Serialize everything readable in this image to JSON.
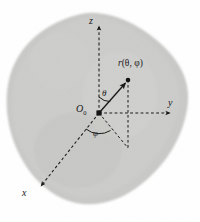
{
  "figure": {
    "kind": "spherical-coordinate-diagram",
    "caption": "",
    "background_color": "#ffffff"
  },
  "body_region": {
    "name": "irregular-solid-blob",
    "fill_color": "#c9c9c7",
    "edge_color": "#b6b6b3",
    "description": "irregular gray solid occupying most of the frame"
  },
  "origin": {
    "label": "O",
    "subscript": "0",
    "marker": "filled-square",
    "x": 99,
    "y": 113
  },
  "axes": [
    {
      "id": "z",
      "label": "z",
      "style": "dashed",
      "arrow": true,
      "from": [
        99,
        113
      ],
      "to": [
        99,
        20
      ],
      "label_x": 89,
      "label_y": 24
    },
    {
      "id": "y",
      "label": "y",
      "style": "dashed",
      "arrow": true,
      "from": [
        99,
        113
      ],
      "to": [
        176,
        113
      ],
      "label_x": 168,
      "label_y": 106
    },
    {
      "id": "x",
      "label": "x",
      "style": "dashed",
      "arrow": true,
      "from": [
        99,
        113
      ],
      "to": [
        36,
        192
      ],
      "label_x": 24,
      "label_y": 196
    }
  ],
  "radius_vector": {
    "label_r": "r",
    "label_args": "(θ, φ)",
    "style": "solid",
    "arrow": true,
    "from": [
      99,
      113
    ],
    "to": [
      128,
      80
    ],
    "endpoint_marker": "filled-circle",
    "label_x": 119,
    "label_y": 66
  },
  "angles": [
    {
      "id": "theta",
      "label": "θ",
      "between": [
        "z",
        "r"
      ],
      "label_x": 103,
      "label_y": 95
    },
    {
      "id": "phi",
      "label": "φ",
      "between": [
        "x",
        "projection"
      ],
      "label_x": 94,
      "label_y": 134
    }
  ],
  "projection": {
    "style": "dashed",
    "drop_line_from": [
      128,
      80
    ],
    "drop_line_to": [
      128,
      148
    ],
    "radial_from": [
      99,
      113
    ],
    "radial_to": [
      128,
      148
    ],
    "description": "dashed drop line from the point to the xy-plane and dashed projection of the radius onto the xy-plane"
  },
  "colors": {
    "ink": "#1a1a1a",
    "blob": "#c9c9c7",
    "paper": "#ffffff"
  }
}
